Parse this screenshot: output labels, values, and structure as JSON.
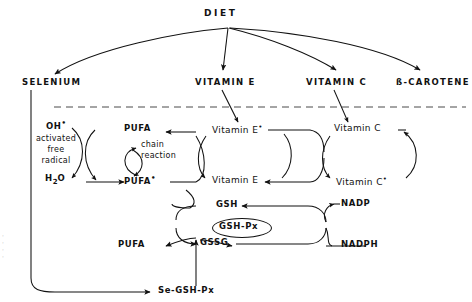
{
  "diagram": {
    "title": "DIET",
    "type": "antioxidant-pathway-flow-diagram",
    "membrane_line": "dashed-horizontal-divider",
    "nutrients": [
      {
        "id": "selenium",
        "label": "SELENIUM"
      },
      {
        "id": "vitamin-e",
        "label": "VITAMIN E"
      },
      {
        "id": "vitamin-c",
        "label": "VITAMIN C"
      },
      {
        "id": "b-carotene",
        "label": "ß-CAROTENE"
      }
    ],
    "radical_cycle": {
      "oh_radical": "OH",
      "oh_radical_dot": "•",
      "note_line_1": "activated",
      "note_line_2": "free",
      "note_line_3": "radical",
      "water": "H",
      "water_sub": "2",
      "water_tail": "O",
      "pufa": "PUFA",
      "pufa_radical": "PUFA",
      "pufa_radical_dot": "•",
      "chain_line_1": "chain",
      "chain_line_2": "reaction"
    },
    "vitamin_e_cycle": {
      "oxidized": "Vitamin E",
      "oxidized_dot": "•",
      "reduced": "Vitamin E"
    },
    "vitamin_c_cycle": {
      "reduced": "Vitamin C",
      "oxidized": "Vitamin C",
      "oxidized_dot": "•"
    },
    "glutathione_cycle": {
      "gsh": "GSH",
      "gssg": "GSSG",
      "enzyme": "GSH-Px",
      "nadp": "NADP",
      "nadph": "NADPH",
      "pufa_product": "PUFA",
      "se_enzyme": "Se-GSH-Px"
    },
    "colors": {
      "ink": "#111111",
      "background": "#ffffff",
      "divider": "#4a4a4a"
    }
  }
}
